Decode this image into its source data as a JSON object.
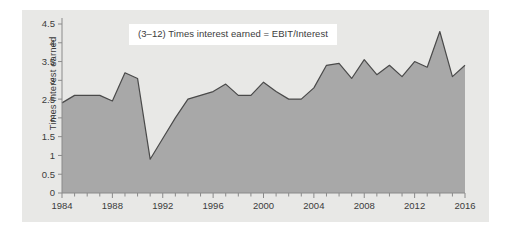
{
  "figure": {
    "panel_bg": "#e8e8e6",
    "outer_bg": "#ffffff",
    "area_fill": "#a8a8a8",
    "line_color": "#4a4a4a",
    "axis_color": "#8a8a8a",
    "text_color": "#3b3b3b",
    "title_box_bg": "#ffffff",
    "title": "(3–12) Times interest earned = EBIT/Interest",
    "ylabel": "Times interest earned"
  },
  "chart_data": {
    "type": "area",
    "title": "(3–12) Times interest earned = EBIT/Interest",
    "xlabel": "",
    "ylabel": "Times interest earned",
    "xlim": [
      1984,
      2016
    ],
    "ylim": [
      0,
      4.5
    ],
    "grid": false,
    "legend": "none",
    "ytick_labels": [
      "0",
      "0.5",
      "1",
      "1.5",
      "2",
      "2.5",
      "3",
      "3.5",
      "4",
      "4.5"
    ],
    "yticks": [
      0,
      0.5,
      1,
      1.5,
      2,
      2.5,
      3,
      3.5,
      4,
      4.5
    ],
    "xtick_labels": [
      "1984",
      "1988",
      "1992",
      "1996",
      "2000",
      "2004",
      "2008",
      "2012",
      "2016"
    ],
    "xticks": [
      1984,
      1988,
      1992,
      1996,
      2000,
      2004,
      2008,
      2012,
      2016
    ],
    "minor_xticks_every": 1,
    "x": [
      1984,
      1985,
      1986,
      1987,
      1988,
      1989,
      1990,
      1991,
      1992,
      1993,
      1994,
      1995,
      1996,
      1997,
      1998,
      1999,
      2000,
      2001,
      2002,
      2003,
      2004,
      2005,
      2006,
      2007,
      2008,
      2009,
      2010,
      2011,
      2012,
      2013,
      2014,
      2015,
      2016
    ],
    "values": [
      2.4,
      2.6,
      2.6,
      2.6,
      2.45,
      3.2,
      3.05,
      0.9,
      1.45,
      2.0,
      2.5,
      2.6,
      2.7,
      2.9,
      2.6,
      2.6,
      2.95,
      2.7,
      2.5,
      2.5,
      2.8,
      3.4,
      3.45,
      3.05,
      3.55,
      3.15,
      3.4,
      3.1,
      3.5,
      3.35,
      4.3,
      3.1,
      3.4
    ],
    "series": [
      {
        "name": "Times interest earned",
        "values": [
          2.4,
          2.6,
          2.6,
          2.6,
          2.45,
          3.2,
          3.05,
          0.9,
          1.45,
          2.0,
          2.5,
          2.6,
          2.7,
          2.9,
          2.6,
          2.6,
          2.95,
          2.7,
          2.5,
          2.5,
          2.8,
          3.4,
          3.45,
          3.05,
          3.55,
          3.15,
          3.4,
          3.1,
          3.5,
          3.35,
          4.3,
          3.1,
          3.4
        ]
      }
    ]
  }
}
